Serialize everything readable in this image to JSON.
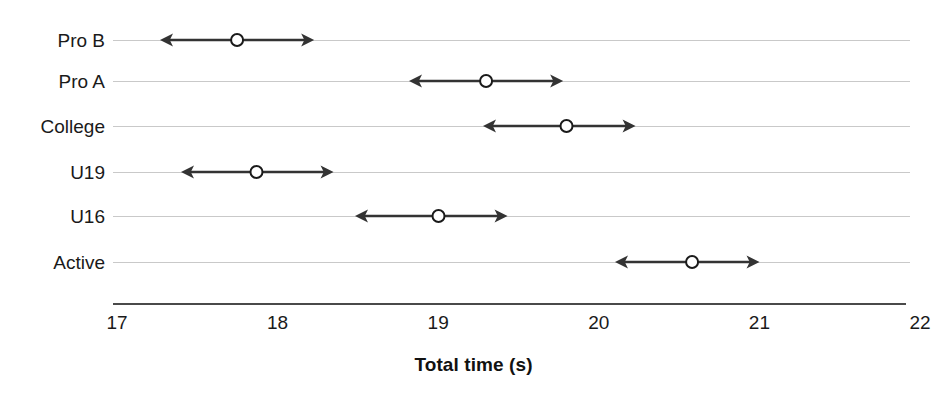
{
  "chart_data": {
    "type": "scatter",
    "title": "",
    "xlabel": "Total time (s)",
    "ylabel": "",
    "xlim": [
      17,
      22
    ],
    "xticks": [
      "17",
      "18",
      "19",
      "20",
      "21",
      "22"
    ],
    "grid": true,
    "legend": null,
    "orientation": "horizontal",
    "marker": "open-circle",
    "error_style": "double-headed-arrow",
    "categories": [
      "Pro B",
      "Pro A",
      "College",
      "U19",
      "U16",
      "Active"
    ],
    "values": [
      17.75,
      19.3,
      19.8,
      17.87,
      19.0,
      20.58
    ],
    "ranges": [
      {
        "category": "Pro B",
        "center": 17.75,
        "low": 17.27,
        "high": 18.23
      },
      {
        "category": "Pro A",
        "center": 19.3,
        "low": 18.82,
        "high": 19.78
      },
      {
        "category": "College",
        "center": 19.8,
        "low": 19.28,
        "high": 20.23
      },
      {
        "category": "U19",
        "center": 17.87,
        "low": 17.4,
        "high": 18.35
      },
      {
        "category": "U16",
        "center": 19.0,
        "low": 18.48,
        "high": 19.43
      },
      {
        "category": "Active",
        "center": 20.58,
        "low": 20.1,
        "high": 21.0
      }
    ]
  },
  "style": {
    "arrow_color": "#333333",
    "marker_fill": "#ffffff",
    "marker_stroke": "#1a1a1a",
    "gridline_color": "#c9c9c9",
    "axis_color": "#4a4a4a",
    "text_color": "#1a1a1a",
    "background": "#ffffff"
  },
  "geometry": {
    "x_at_min": 117,
    "x_at_max": 920,
    "grid_left": 113,
    "grid_right": 910,
    "axis_left": 113,
    "axis_right": 906,
    "axis_y": 303,
    "label_right": 105,
    "tick_label_y": 313,
    "title_y": 355,
    "row_y": [
      40,
      81,
      126,
      172,
      216,
      262
    ]
  }
}
